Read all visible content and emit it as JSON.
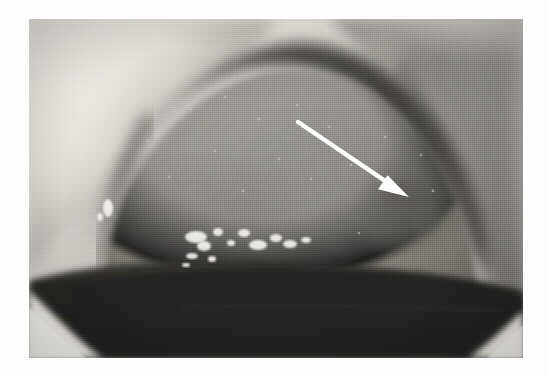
{
  "image": {
    "kind": "clinical-photograph",
    "modality": "color clinical photograph (greyscale halftone reproduction)",
    "subject": "intraoral view of the ventral / lateral tongue and floor of mouth",
    "caption_text": "",
    "background_color": "#fdfdfd",
    "frame": {
      "left_px": 29,
      "top_px": 19,
      "width_px": 494,
      "height_px": 339,
      "border_color": "#ffffff"
    },
    "palette": {
      "highlight_white": "#f2f0ec",
      "lip_light": "#d8d5cf",
      "tongue_mid_grey": "#8f8d88",
      "tongue_dark_grey": "#6e6c67",
      "shadow_band": "#4b4945",
      "oral_cavity_dark": "#2a2926",
      "deep_black": "#171614"
    }
  },
  "annotations": [
    {
      "name": "pointer-arrow",
      "type": "arrow",
      "color": "#ffffff",
      "tail_px": [
        298,
        122
      ],
      "tip_px": [
        409,
        197
      ],
      "points_to": "mottled lesion on the right lateral border of the tongue",
      "label": ""
    }
  ],
  "regions": [
    {
      "name": "upper-lip-mucosa",
      "location": "upper-left",
      "tone": "light grey"
    },
    {
      "name": "tongue-dorsum",
      "location": "centre / upper",
      "tone": "mid grey, finely granular"
    },
    {
      "name": "lesion-area",
      "location": "right of centre",
      "tone": "irregular darker mottling at arrow tip"
    },
    {
      "name": "lateral-shadow-fold",
      "location": "right",
      "tone": "dark diagonal band"
    },
    {
      "name": "specular-highlights",
      "location": "lower centre-left",
      "tone": "bright saliva reflections"
    },
    {
      "name": "oral-cavity-floor",
      "location": "lower third",
      "tone": "near black"
    },
    {
      "name": "lower-lip-left",
      "location": "bottom-left corner",
      "tone": "bright wedge"
    },
    {
      "name": "lower-lip-right",
      "location": "bottom-right corner",
      "tone": "bright wedge"
    }
  ],
  "specular_highlights": [
    {
      "cx": 108,
      "cy": 208,
      "rx": 5,
      "ry": 9
    },
    {
      "cx": 100,
      "cy": 217,
      "rx": 3,
      "ry": 4
    },
    {
      "cx": 196,
      "cy": 237,
      "rx": 11,
      "ry": 6
    },
    {
      "cx": 204,
      "cy": 246,
      "rx": 7,
      "ry": 5
    },
    {
      "cx": 218,
      "cy": 232,
      "rx": 5,
      "ry": 4
    },
    {
      "cx": 231,
      "cy": 243,
      "rx": 4,
      "ry": 3
    },
    {
      "cx": 244,
      "cy": 233,
      "rx": 6,
      "ry": 4
    },
    {
      "cx": 258,
      "cy": 245,
      "rx": 9,
      "ry": 5
    },
    {
      "cx": 276,
      "cy": 238,
      "rx": 6,
      "ry": 4
    },
    {
      "cx": 290,
      "cy": 244,
      "rx": 7,
      "ry": 4
    },
    {
      "cx": 306,
      "cy": 240,
      "rx": 5,
      "ry": 3
    },
    {
      "cx": 192,
      "cy": 256,
      "rx": 6,
      "ry": 3
    },
    {
      "cx": 212,
      "cy": 259,
      "rx": 4,
      "ry": 3
    },
    {
      "cx": 186,
      "cy": 265,
      "rx": 4,
      "ry": 2
    }
  ]
}
